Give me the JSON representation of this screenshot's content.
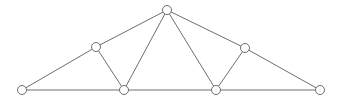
{
  "figure": {
    "title": "",
    "background_color": "#ffffff",
    "width": 341,
    "height": 104
  },
  "style": {
    "edge_color": "#6e6e6e",
    "edge_width": 1,
    "node_stroke_color": "#6e6e6e",
    "node_fill_color": "#ffffff",
    "node_radius": 4.5
  },
  "graph": {
    "type": "truss-diagram",
    "node_count": 7,
    "edge_count": 11,
    "nodes": [
      {
        "id": "n0",
        "name": "left-support-node",
        "label": "",
        "x": 22,
        "y": 90
      },
      {
        "id": "n1",
        "name": "left-upper-chord-node",
        "label": "",
        "x": 96,
        "y": 47
      },
      {
        "id": "n2",
        "name": "apex-node",
        "label": "",
        "x": 167,
        "y": 10
      },
      {
        "id": "n3",
        "name": "right-upper-chord-node",
        "label": "",
        "x": 245,
        "y": 48
      },
      {
        "id": "n4",
        "name": "right-support-node",
        "label": "",
        "x": 320,
        "y": 90
      },
      {
        "id": "n5",
        "name": "left-bottom-panel-node",
        "label": "",
        "x": 124,
        "y": 90
      },
      {
        "id": "n6",
        "name": "right-bottom-panel-node",
        "label": "",
        "x": 216,
        "y": 90
      }
    ],
    "edges": [
      {
        "name": "edge-left-support-to-left-upper",
        "from": "n0",
        "to": "n1"
      },
      {
        "name": "edge-left-upper-to-apex",
        "from": "n1",
        "to": "n2"
      },
      {
        "name": "edge-apex-to-right-upper",
        "from": "n2",
        "to": "n3"
      },
      {
        "name": "edge-right-upper-to-right-support",
        "from": "n3",
        "to": "n4"
      },
      {
        "name": "edge-left-support-to-left-bottom",
        "from": "n0",
        "to": "n5"
      },
      {
        "name": "edge-left-bottom-to-right-bottom",
        "from": "n5",
        "to": "n6"
      },
      {
        "name": "edge-right-bottom-to-right-support",
        "from": "n6",
        "to": "n4"
      },
      {
        "name": "edge-left-upper-to-left-bottom",
        "from": "n1",
        "to": "n5"
      },
      {
        "name": "edge-apex-to-left-bottom",
        "from": "n2",
        "to": "n5"
      },
      {
        "name": "edge-apex-to-right-bottom",
        "from": "n2",
        "to": "n6"
      },
      {
        "name": "edge-right-upper-to-right-bottom",
        "from": "n3",
        "to": "n6"
      }
    ]
  }
}
